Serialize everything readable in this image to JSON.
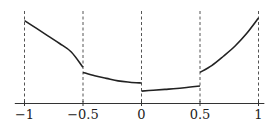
{
  "chart_data": {
    "type": "line",
    "title": "",
    "xlabel": "",
    "ylabel": "",
    "xlim": [
      -1.1,
      1.05
    ],
    "ylim": [
      0,
      1
    ],
    "grid": false,
    "legend": "none",
    "xticks": [
      -1,
      -0.5,
      0,
      0.5,
      1
    ],
    "xtick_labels": [
      "−1",
      "−0.5",
      "0",
      "0.5",
      "1"
    ],
    "vertical_dashed_lines": [
      -1,
      -0.5,
      0,
      0.5,
      1
    ],
    "line_color": "#222222",
    "dash_color": "#555555",
    "series": [
      {
        "name": "piece-1",
        "x": [
          -1,
          -0.9,
          -0.8,
          -0.7,
          -0.6,
          -0.5
        ],
        "y": [
          0.97,
          0.88,
          0.79,
          0.7,
          0.6,
          0.42
        ]
      },
      {
        "name": "piece-2",
        "x": [
          -0.5,
          -0.4,
          -0.3,
          -0.2,
          -0.1,
          0
        ],
        "y": [
          0.36,
          0.32,
          0.29,
          0.26,
          0.245,
          0.235
        ]
      },
      {
        "name": "piece-3",
        "x": [
          0,
          0.1,
          0.2,
          0.3,
          0.4,
          0.5
        ],
        "y": [
          0.14,
          0.15,
          0.16,
          0.17,
          0.185,
          0.2
        ]
      },
      {
        "name": "piece-4",
        "x": [
          0.5,
          0.6,
          0.7,
          0.8,
          0.9,
          1
        ],
        "y": [
          0.36,
          0.44,
          0.55,
          0.67,
          0.82,
          1.0
        ]
      }
    ]
  }
}
